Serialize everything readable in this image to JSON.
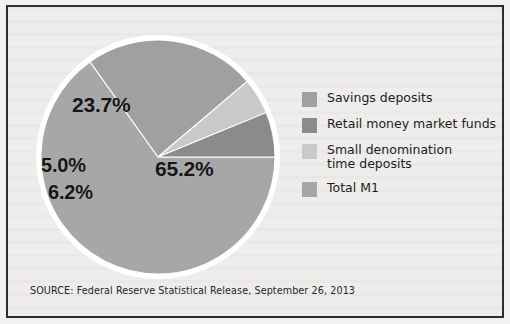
{
  "figure": {
    "source_note": "SOURCE: Federal Reserve Statistical Release, September 26, 2013",
    "background_color": "#eeedeb",
    "frame_color": "#2e2e2e"
  },
  "legend": {
    "items": [
      {
        "label": "Savings deposits",
        "color": "#a0a0a0"
      },
      {
        "label": "Retail money market funds",
        "color": "#8b8b8b"
      },
      {
        "label": "Small denomination\ntime deposits",
        "color": "#c9c9c9"
      },
      {
        "label": "Total M1",
        "color": "#a7a7a7"
      }
    ]
  },
  "chart_data": {
    "type": "pie",
    "title": "",
    "categories": [
      "Total M1",
      "Savings deposits",
      "Small denomination time deposits",
      "Retail money market funds"
    ],
    "values": [
      65.2,
      23.7,
      5.0,
      6.2
    ],
    "labels": [
      "65.2%",
      "23.7%",
      "5.0%",
      "6.2%"
    ],
    "colors": [
      "#a7a7a7",
      "#a0a0a0",
      "#c9c9c9",
      "#8b8b8b"
    ],
    "units": "percent",
    "legend_position": "right",
    "grid": false,
    "start_angle_deg": 0,
    "slice_outline_color": "#ffffff"
  }
}
